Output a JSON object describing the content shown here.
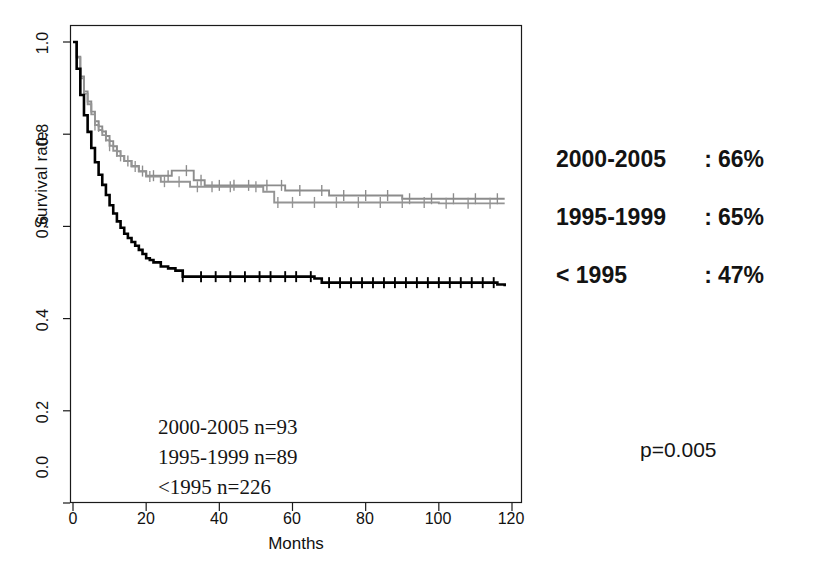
{
  "chart_data": {
    "type": "line",
    "title": "",
    "xlabel": "Months",
    "ylabel": "Survival rate",
    "xlim": [
      0,
      120
    ],
    "ylim": [
      0.0,
      1.0
    ],
    "xticks": [
      "0",
      "20",
      "40",
      "60",
      "80",
      "100",
      "120"
    ],
    "yticks": [
      "0.0",
      "0.2",
      "0.4",
      "0.6",
      "0.8",
      "1.0"
    ],
    "grid": false,
    "legend_position": "right-outside",
    "plot_style": "kaplan-meier step curves with censoring tick marks",
    "series": [
      {
        "name": "2000-2005",
        "color": "#8c8c8c",
        "n": 93,
        "final_survival_pct": "66%",
        "points": [
          [
            0,
            1.0
          ],
          [
            1,
            0.968
          ],
          [
            2,
            0.925
          ],
          [
            3,
            0.893
          ],
          [
            4,
            0.871
          ],
          [
            5,
            0.849
          ],
          [
            6,
            0.828
          ],
          [
            7,
            0.817
          ],
          [
            8,
            0.806
          ],
          [
            9,
            0.796
          ],
          [
            10,
            0.785
          ],
          [
            11,
            0.774
          ],
          [
            12,
            0.763
          ],
          [
            13,
            0.753
          ],
          [
            14,
            0.742
          ],
          [
            16,
            0.731
          ],
          [
            18,
            0.72
          ],
          [
            20,
            0.71
          ],
          [
            24,
            0.71
          ],
          [
            27,
            0.721
          ],
          [
            30,
            0.721
          ],
          [
            33,
            0.7
          ],
          [
            36,
            0.689
          ],
          [
            40,
            0.689
          ],
          [
            46,
            0.689
          ],
          [
            52,
            0.689
          ],
          [
            58,
            0.678
          ],
          [
            64,
            0.678
          ],
          [
            70,
            0.667
          ],
          [
            80,
            0.667
          ],
          [
            90,
            0.66
          ],
          [
            100,
            0.66
          ],
          [
            110,
            0.66
          ],
          [
            118,
            0.66
          ]
        ],
        "censor_times": [
          7,
          9,
          12,
          15,
          19,
          22,
          26,
          31,
          35,
          40,
          44,
          48,
          53,
          57,
          62,
          68,
          74,
          80,
          86,
          92,
          98,
          104,
          110,
          116
        ]
      },
      {
        "name": "1995-1999",
        "color": "#949494",
        "n": 89,
        "final_survival_pct": "65%",
        "points": [
          [
            0,
            1.0
          ],
          [
            1,
            0.966
          ],
          [
            2,
            0.921
          ],
          [
            3,
            0.888
          ],
          [
            4,
            0.865
          ],
          [
            5,
            0.843
          ],
          [
            6,
            0.82
          ],
          [
            7,
            0.809
          ],
          [
            8,
            0.798
          ],
          [
            9,
            0.787
          ],
          [
            10,
            0.775
          ],
          [
            11,
            0.764
          ],
          [
            12,
            0.753
          ],
          [
            14,
            0.742
          ],
          [
            16,
            0.73
          ],
          [
            18,
            0.719
          ],
          [
            20,
            0.708
          ],
          [
            24,
            0.697
          ],
          [
            28,
            0.697
          ],
          [
            32,
            0.686
          ],
          [
            36,
            0.686
          ],
          [
            42,
            0.686
          ],
          [
            48,
            0.686
          ],
          [
            52,
            0.675
          ],
          [
            55,
            0.652
          ],
          [
            62,
            0.652
          ],
          [
            70,
            0.652
          ],
          [
            80,
            0.652
          ],
          [
            90,
            0.652
          ],
          [
            100,
            0.65
          ],
          [
            110,
            0.65
          ],
          [
            118,
            0.65
          ]
        ],
        "censor_times": [
          6,
          10,
          13,
          17,
          21,
          25,
          29,
          34,
          38,
          43,
          50,
          56,
          60,
          66,
          72,
          78,
          84,
          90,
          96,
          102,
          108,
          114
        ]
      },
      {
        "name": "< 1995",
        "color": "#000000",
        "n": 226,
        "final_survival_pct": "47%",
        "points": [
          [
            0,
            1.0
          ],
          [
            1,
            0.942
          ],
          [
            2,
            0.885
          ],
          [
            3,
            0.841
          ],
          [
            4,
            0.805
          ],
          [
            5,
            0.77
          ],
          [
            6,
            0.739
          ],
          [
            7,
            0.712
          ],
          [
            8,
            0.69
          ],
          [
            9,
            0.668
          ],
          [
            10,
            0.646
          ],
          [
            11,
            0.628
          ],
          [
            12,
            0.611
          ],
          [
            13,
            0.597
          ],
          [
            14,
            0.584
          ],
          [
            15,
            0.575
          ],
          [
            16,
            0.566
          ],
          [
            17,
            0.558
          ],
          [
            18,
            0.549
          ],
          [
            19,
            0.54
          ],
          [
            20,
            0.531
          ],
          [
            21,
            0.527
          ],
          [
            22,
            0.522
          ],
          [
            24,
            0.513
          ],
          [
            26,
            0.509
          ],
          [
            28,
            0.504
          ],
          [
            30,
            0.491
          ],
          [
            34,
            0.491
          ],
          [
            40,
            0.491
          ],
          [
            48,
            0.491
          ],
          [
            56,
            0.491
          ],
          [
            62,
            0.491
          ],
          [
            66,
            0.487
          ],
          [
            68,
            0.478
          ],
          [
            74,
            0.478
          ],
          [
            82,
            0.478
          ],
          [
            90,
            0.478
          ],
          [
            100,
            0.478
          ],
          [
            110,
            0.478
          ],
          [
            116,
            0.474
          ],
          [
            118,
            0.47
          ]
        ],
        "censor_times": [
          30,
          35,
          39,
          43,
          47,
          51,
          54,
          58,
          61,
          65,
          70,
          73,
          76,
          79,
          82,
          85,
          88,
          91,
          94,
          97,
          100,
          103,
          106,
          109,
          112,
          115
        ]
      }
    ]
  },
  "axes": {
    "y_title": "Survival rate",
    "x_title": "Months",
    "y_tick_labels": [
      "1.0",
      "0.8",
      "0.6",
      "0.4",
      "0.2",
      "0.0"
    ],
    "x_tick_labels": [
      "0",
      "20",
      "40",
      "60",
      "80",
      "100",
      "120"
    ]
  },
  "inplot_annotations": [
    "2000-2005 n=93",
    "1995-1999 n=89",
    "<1995 n=226"
  ],
  "side_legend": {
    "rows": [
      {
        "period": "2000-2005",
        "separator": ":",
        "value": "66%"
      },
      {
        "period": "1995-1999",
        "separator": ":",
        "value": "65%"
      },
      {
        "period": "< 1995",
        "separator": ":",
        "value": "47%"
      }
    ]
  },
  "pvalue": "p=0.005",
  "colors": {
    "background": "#ffffff",
    "axis": "#1a1a1a",
    "series_black": "#000000",
    "series_gray": "#8c8c8c",
    "text": "#111111"
  }
}
